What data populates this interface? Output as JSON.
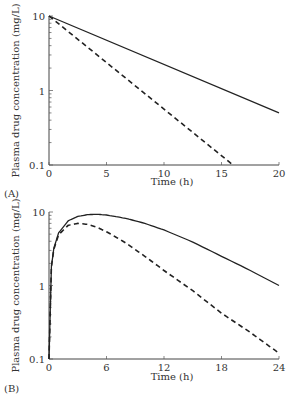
{
  "chart_data": [
    {
      "type": "line",
      "panel": "(A)",
      "xlabel": "Time (h)",
      "ylabel": "Plasma drug concentration (mg/L)",
      "yscale": "log",
      "xlim": [
        0,
        20
      ],
      "ylim": [
        0.1,
        10
      ],
      "xticks": [
        "0",
        "5",
        "10",
        "15",
        "20"
      ],
      "yticks": [
        "0.1",
        "1",
        "10"
      ],
      "grid": false,
      "series": [
        {
          "name": "solid",
          "style": "solid",
          "x": [
            0,
            20
          ],
          "y": [
            10,
            0.5
          ]
        },
        {
          "name": "dashed",
          "style": "dashed",
          "x": [
            0,
            16
          ],
          "y": [
            10,
            0.1
          ]
        }
      ]
    },
    {
      "type": "line",
      "panel": "(B)",
      "xlabel": "Time (h)",
      "ylabel": "Plasma drug concentration (mg/L)",
      "yscale": "log",
      "xlim": [
        0,
        24
      ],
      "ylim": [
        0.1,
        10
      ],
      "xticks": [
        "0",
        "6",
        "12",
        "18",
        "24"
      ],
      "yticks": [
        "0.1",
        "1",
        "10"
      ],
      "grid": false,
      "series": [
        {
          "name": "solid",
          "style": "solid",
          "x": [
            0,
            0.25,
            0.5,
            1,
            2,
            3,
            4,
            5,
            6,
            8,
            10,
            12,
            15,
            18,
            21,
            24
          ],
          "y": [
            0.1,
            1.8,
            3.2,
            5.2,
            7.6,
            8.7,
            9.2,
            9.3,
            9.1,
            8.2,
            7.0,
            5.7,
            3.9,
            2.5,
            1.6,
            1.0
          ]
        },
        {
          "name": "dashed",
          "style": "dashed",
          "x": [
            0,
            0.25,
            0.5,
            1,
            2,
            3,
            4,
            5,
            6,
            8,
            10,
            12,
            15,
            18,
            21,
            24
          ],
          "y": [
            0.1,
            1.8,
            3.1,
            4.9,
            6.6,
            7.0,
            6.8,
            6.2,
            5.4,
            3.8,
            2.5,
            1.6,
            0.85,
            0.42,
            0.23,
            0.12
          ]
        }
      ]
    }
  ]
}
